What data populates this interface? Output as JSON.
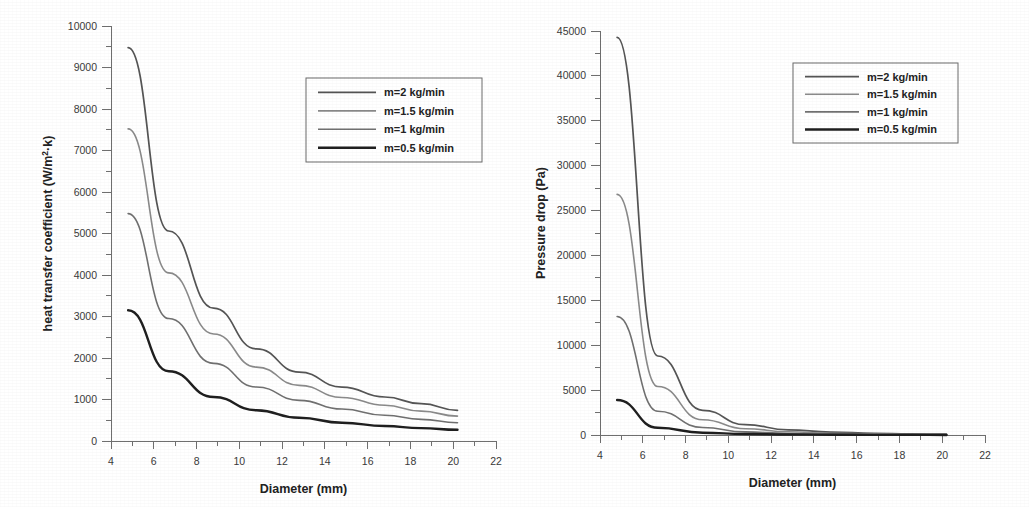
{
  "figure": {
    "panels": [
      "heat-transfer-coefficient",
      "pressure-drop"
    ]
  },
  "chart_data": [
    {
      "type": "line",
      "id": "heat-transfer-coefficient",
      "title": "",
      "xlabel": "Diameter (mm)",
      "ylabel": "heat transfer coefficient (W/m2·k)",
      "ylabel_base": "heat transfer coefficient (W/m",
      "ylabel_sup": "2",
      "ylabel_tail": "·k)",
      "xlim": [
        4,
        22
      ],
      "ylim": [
        0,
        10000
      ],
      "xticks": [
        4,
        6,
        8,
        10,
        12,
        14,
        16,
        18,
        20,
        22
      ],
      "xticklabels": [
        "4",
        "6",
        "8",
        "10",
        "12",
        "14",
        "16",
        "18",
        "20",
        "22"
      ],
      "xminor_step": 1,
      "yticks": [
        0,
        1000,
        2000,
        3000,
        4000,
        5000,
        6000,
        7000,
        8000,
        9000,
        10000
      ],
      "yticklabels": [
        "0",
        "1000",
        "2000",
        "3000",
        "4000",
        "5000",
        "6000",
        "7000",
        "8000",
        "9000",
        "10000"
      ],
      "yminor_step": 500,
      "grid": false,
      "legend_position": "upper-right",
      "x": [
        4.8,
        6.7,
        8.8,
        10.8,
        12.8,
        14.8,
        16.8,
        18.5,
        20.2
      ],
      "series": [
        {
          "name": "m=2 kg/min",
          "color": "#555555",
          "width": 1.7,
          "values": [
            9480,
            5060,
            3200,
            2220,
            1660,
            1300,
            1060,
            900,
            740
          ]
        },
        {
          "name": "m=1.5 kg/min",
          "color": "#8a8a8a",
          "width": 1.6,
          "values": [
            7520,
            4050,
            2580,
            1780,
            1340,
            1050,
            860,
            720,
            600
          ]
        },
        {
          "name": "m=1 kg/min",
          "color": "#707070",
          "width": 1.6,
          "values": [
            5480,
            2950,
            1870,
            1300,
            980,
            770,
            620,
            520,
            440
          ]
        },
        {
          "name": "m=0.5 kg/min",
          "color": "#1f1f1f",
          "width": 2.4,
          "values": [
            3150,
            1680,
            1060,
            740,
            560,
            440,
            360,
            310,
            270
          ]
        }
      ]
    },
    {
      "type": "line",
      "id": "pressure-drop",
      "title": "",
      "xlabel": "Diameter (mm)",
      "ylabel": "Pressure drop (Pa)",
      "xlim": [
        4,
        22
      ],
      "ylim": [
        0,
        45000
      ],
      "xticks": [
        4,
        6,
        8,
        10,
        12,
        14,
        16,
        18,
        20,
        22
      ],
      "xticklabels": [
        "4",
        "6",
        "8",
        "10",
        "12",
        "14",
        "16",
        "18",
        "20",
        "22"
      ],
      "xminor_step": 1,
      "yticks": [
        0,
        5000,
        10000,
        15000,
        20000,
        25000,
        30000,
        35000,
        40000,
        45000
      ],
      "yticklabels": [
        "0",
        "5000",
        "10000",
        "15000",
        "20000",
        "25000",
        "30000",
        "35000",
        "40000",
        "45000"
      ],
      "yminor_step": 2500,
      "grid": false,
      "legend_position": "upper-right",
      "x": [
        4.8,
        6.7,
        8.8,
        10.8,
        12.8,
        14.8,
        16.8,
        18.5,
        20.2
      ],
      "series": [
        {
          "name": "m=2 kg/min",
          "color": "#555555",
          "width": 1.7,
          "values": [
            44300,
            8800,
            2750,
            1150,
            580,
            320,
            190,
            130,
            90
          ]
        },
        {
          "name": "m=1.5 kg/min",
          "color": "#8a8a8a",
          "width": 1.6,
          "values": [
            26800,
            5400,
            1700,
            700,
            360,
            200,
            120,
            80,
            55
          ]
        },
        {
          "name": "m=1 kg/min",
          "color": "#707070",
          "width": 1.6,
          "values": [
            13200,
            2650,
            840,
            350,
            175,
            100,
            60,
            40,
            28
          ]
        },
        {
          "name": "m=0.5 kg/min",
          "color": "#1f1f1f",
          "width": 2.4,
          "values": [
            3900,
            800,
            250,
            105,
            52,
            29,
            18,
            12,
            8
          ]
        }
      ]
    }
  ]
}
